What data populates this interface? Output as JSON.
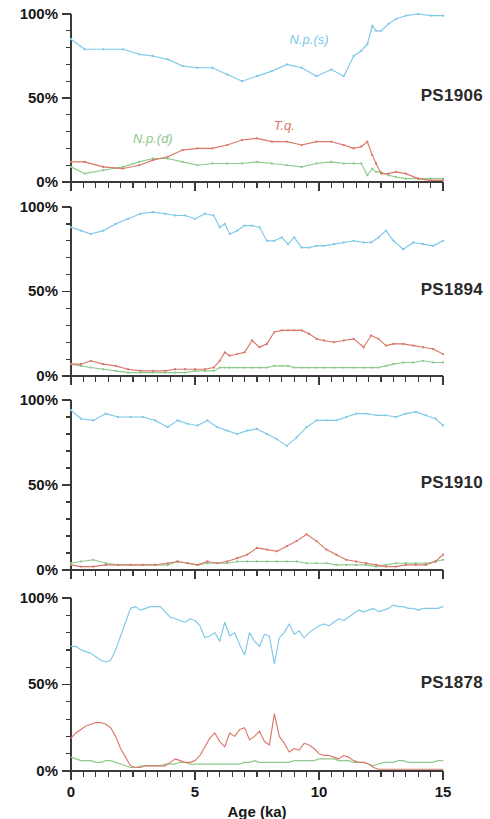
{
  "figure": {
    "axis_title_x": "Age (ka)",
    "y_tick_labels": [
      "0%",
      "50%",
      "100%"
    ],
    "x_tick_labels": [
      "0",
      "5",
      "10",
      "15"
    ],
    "colors": {
      "np_s": "#7ec9e8",
      "np_d": "#8fc98c",
      "tq": "#d9786a",
      "axis": "#3a3a3a",
      "title": "#2a2a2a",
      "background": "#ffffff"
    },
    "series_labels": {
      "np_s": "N.p.(s)",
      "np_d": "N.p.(d)",
      "tq": "T.q."
    }
  },
  "chart_data": [
    {
      "type": "line",
      "title": "PS1906",
      "xlabel": "Age (ka)",
      "ylabel": "",
      "xlim": [
        0,
        15
      ],
      "ylim": [
        0,
        100
      ],
      "grid": false,
      "legend_position": "inline-annotations",
      "annotations": [
        {
          "text": "N.p.(s)",
          "x": 9.6,
          "y": 82,
          "series": "np_s"
        },
        {
          "text": "N.p.(d)",
          "x": 3.3,
          "y": 23,
          "series": "np_d"
        },
        {
          "text": "T.q.",
          "x": 8.6,
          "y": 31,
          "series": "tq"
        }
      ],
      "x": [
        0.0,
        0.55,
        1.3,
        2.1,
        2.75,
        3.3,
        3.9,
        4.5,
        5.1,
        5.7,
        6.3,
        6.9,
        7.5,
        8.1,
        8.7,
        9.3,
        9.9,
        10.5,
        11.0,
        11.4,
        11.7,
        11.95,
        12.15,
        12.3,
        12.5,
        12.8,
        13.1,
        13.5,
        14.0,
        14.5,
        15.0
      ],
      "series": [
        {
          "name": "N.p.(s)",
          "key": "np_s",
          "values": [
            85,
            79,
            79,
            79,
            76,
            75,
            73,
            69,
            68,
            68,
            64,
            60,
            63,
            66,
            70,
            68,
            63,
            67,
            63,
            75,
            78,
            82,
            93,
            90,
            90,
            94,
            97,
            99,
            100,
            99,
            99
          ]
        },
        {
          "name": "N.p.(d)",
          "key": "np_d",
          "values": [
            9,
            5,
            7,
            9,
            12,
            14,
            14,
            12,
            10,
            11,
            11,
            11,
            12,
            11,
            10,
            9,
            11,
            12,
            11,
            11,
            11,
            4,
            8,
            6,
            6,
            4,
            3,
            2,
            2,
            2,
            2
          ]
        },
        {
          "name": "T.q.",
          "key": "tq",
          "values": [
            12,
            12,
            9,
            8,
            10,
            13,
            15,
            19,
            20,
            20,
            22,
            25,
            26,
            24,
            24,
            22,
            24,
            24,
            22,
            20,
            21,
            24,
            16,
            11,
            5,
            5,
            6,
            5,
            2,
            1,
            1
          ]
        }
      ]
    },
    {
      "type": "line",
      "title": "PS1894",
      "xlabel": "Age (ka)",
      "ylabel": "",
      "xlim": [
        0,
        15
      ],
      "ylim": [
        0,
        100
      ],
      "grid": false,
      "legend_position": "none",
      "annotations": [],
      "x": [
        0.0,
        0.4,
        0.8,
        1.3,
        1.8,
        2.3,
        2.8,
        3.3,
        3.8,
        4.2,
        4.6,
        5.0,
        5.4,
        5.75,
        6.0,
        6.2,
        6.4,
        6.7,
        7.0,
        7.3,
        7.6,
        7.9,
        8.2,
        8.5,
        8.75,
        9.0,
        9.3,
        9.6,
        9.9,
        10.2,
        10.6,
        11.0,
        11.4,
        11.8,
        12.1,
        12.4,
        12.7,
        13.0,
        13.4,
        13.8,
        14.2,
        14.6,
        15.0
      ],
      "series": [
        {
          "name": "N.p.(s)",
          "key": "np_s",
          "values": [
            88,
            86,
            84,
            86,
            90,
            93,
            96,
            97,
            96,
            95,
            95,
            93,
            96,
            95,
            88,
            90,
            84,
            86,
            89,
            89,
            88,
            80,
            80,
            82,
            78,
            82,
            76,
            76,
            77,
            77,
            78,
            79,
            80,
            79,
            79,
            82,
            86,
            80,
            75,
            79,
            78,
            77,
            80
          ]
        },
        {
          "name": "N.p.(d)",
          "key": "np_d",
          "values": [
            7,
            6,
            5,
            4,
            3,
            2,
            2,
            2,
            2,
            2,
            2,
            3,
            3,
            3,
            5,
            5,
            5,
            5,
            5,
            5,
            5,
            5,
            6,
            6,
            6,
            5,
            5,
            5,
            5,
            5,
            5,
            5,
            5,
            5,
            5,
            5,
            6,
            7,
            8,
            8,
            9,
            8,
            8
          ]
        },
        {
          "name": "T.q.",
          "key": "tq",
          "values": [
            7,
            7,
            9,
            7,
            6,
            4,
            3,
            3,
            3,
            4,
            4,
            4,
            4,
            5,
            9,
            14,
            12,
            13,
            14,
            21,
            17,
            19,
            26,
            27,
            27,
            27,
            27,
            25,
            22,
            21,
            20,
            21,
            22,
            17,
            24,
            22,
            18,
            19,
            19,
            18,
            17,
            16,
            13
          ]
        }
      ]
    },
    {
      "type": "line",
      "title": "PS1910",
      "xlabel": "Age (ka)",
      "ylabel": "",
      "xlim": [
        0,
        15
      ],
      "ylim": [
        0,
        100
      ],
      "grid": false,
      "legend_position": "none",
      "annotations": [],
      "x": [
        0.0,
        0.4,
        0.9,
        1.4,
        1.9,
        2.4,
        2.9,
        3.4,
        3.9,
        4.3,
        4.7,
        5.1,
        5.5,
        5.9,
        6.3,
        6.7,
        7.1,
        7.5,
        7.9,
        8.3,
        8.7,
        9.1,
        9.5,
        9.9,
        10.3,
        10.7,
        11.1,
        11.5,
        11.9,
        12.3,
        12.7,
        13.1,
        13.5,
        13.9,
        14.3,
        14.7,
        15.0
      ],
      "series": [
        {
          "name": "N.p.(s)",
          "key": "np_s",
          "values": [
            94,
            89,
            88,
            92,
            90,
            90,
            90,
            88,
            84,
            88,
            86,
            85,
            88,
            84,
            82,
            80,
            82,
            83,
            80,
            77,
            73,
            78,
            84,
            88,
            88,
            88,
            90,
            92,
            92,
            91,
            91,
            90,
            92,
            93,
            91,
            89,
            85
          ]
        },
        {
          "name": "N.p.(d)",
          "key": "np_d",
          "values": [
            4,
            5,
            6,
            4,
            3,
            3,
            3,
            3,
            3,
            5,
            4,
            3,
            4,
            4,
            4,
            5,
            5,
            5,
            5,
            5,
            5,
            5,
            4,
            4,
            4,
            3,
            3,
            3,
            3,
            2,
            3,
            4,
            4,
            4,
            4,
            5,
            6
          ]
        },
        {
          "name": "T.q.",
          "key": "tq",
          "values": [
            3,
            2,
            2,
            3,
            3,
            3,
            3,
            3,
            4,
            5,
            4,
            3,
            5,
            4,
            5,
            7,
            9,
            13,
            12,
            11,
            14,
            17,
            21,
            17,
            12,
            9,
            6,
            5,
            4,
            3,
            2,
            2,
            3,
            3,
            3,
            5,
            9
          ]
        }
      ]
    },
    {
      "type": "line",
      "title": "PS1878",
      "xlabel": "Age (ka)",
      "ylabel": "",
      "xlim": [
        0,
        15
      ],
      "ylim": [
        0,
        100
      ],
      "grid": false,
      "legend_position": "none",
      "annotations": [],
      "x": [
        0.0,
        0.2,
        0.4,
        0.6,
        0.8,
        1.0,
        1.2,
        1.4,
        1.6,
        1.8,
        2.0,
        2.2,
        2.4,
        2.6,
        2.8,
        3.0,
        3.2,
        3.4,
        3.6,
        3.8,
        4.0,
        4.2,
        4.4,
        4.6,
        4.8,
        5.0,
        5.2,
        5.4,
        5.6,
        5.8,
        6.0,
        6.2,
        6.4,
        6.6,
        6.8,
        7.0,
        7.2,
        7.4,
        7.6,
        7.8,
        8.0,
        8.2,
        8.4,
        8.6,
        8.8,
        9.0,
        9.2,
        9.4,
        9.6,
        9.8,
        10.0,
        10.2,
        10.4,
        10.6,
        10.8,
        11.0,
        11.2,
        11.4,
        11.6,
        11.8,
        12.0,
        12.2,
        12.4,
        12.6,
        12.8,
        13.0,
        13.2,
        13.4,
        13.6,
        13.8,
        14.0,
        14.2,
        14.4,
        14.6,
        14.8,
        15.0
      ],
      "series": [
        {
          "name": "N.p.(s)",
          "key": "np_s",
          "values": [
            72,
            72,
            70,
            69,
            68,
            66,
            64,
            63,
            64,
            70,
            78,
            86,
            94,
            95,
            93,
            94,
            95,
            95,
            95,
            92,
            89,
            88,
            87,
            86,
            88,
            87,
            84,
            77,
            78,
            80,
            75,
            86,
            78,
            80,
            73,
            67,
            80,
            75,
            72,
            79,
            78,
            62,
            77,
            80,
            85,
            79,
            81,
            77,
            80,
            82,
            84,
            85,
            84,
            86,
            88,
            87,
            89,
            91,
            93,
            92,
            93,
            94,
            92,
            93,
            94,
            96,
            95,
            95,
            94,
            94,
            93,
            94,
            94,
            94,
            94,
            95
          ]
        },
        {
          "name": "N.p.(d)",
          "key": "np_d",
          "values": [
            8,
            7,
            6,
            6,
            6,
            5,
            5,
            6,
            6,
            5,
            4,
            3,
            2,
            2,
            3,
            3,
            3,
            3,
            3,
            4,
            4,
            4,
            5,
            5,
            4,
            4,
            4,
            4,
            4,
            4,
            4,
            4,
            4,
            4,
            4,
            5,
            5,
            6,
            5,
            5,
            5,
            5,
            5,
            5,
            5,
            6,
            6,
            6,
            6,
            6,
            7,
            7,
            7,
            7,
            6,
            6,
            6,
            5,
            5,
            5,
            4,
            3,
            4,
            5,
            5,
            5,
            6,
            6,
            5,
            5,
            5,
            5,
            5,
            5,
            6,
            6
          ]
        },
        {
          "name": "T.q.",
          "key": "tq",
          "values": [
            19,
            22,
            24,
            26,
            27,
            28,
            28,
            27,
            25,
            20,
            13,
            8,
            3,
            2,
            2,
            3,
            3,
            3,
            3,
            3,
            5,
            7,
            6,
            5,
            5,
            6,
            9,
            14,
            19,
            22,
            17,
            14,
            22,
            20,
            24,
            25,
            18,
            20,
            23,
            17,
            15,
            33,
            20,
            16,
            11,
            13,
            12,
            16,
            15,
            13,
            10,
            9,
            9,
            8,
            7,
            9,
            8,
            6,
            5,
            5,
            4,
            2,
            1,
            1,
            1,
            1,
            1,
            1,
            1,
            1,
            1,
            1,
            1,
            1,
            1,
            1
          ]
        }
      ]
    }
  ]
}
